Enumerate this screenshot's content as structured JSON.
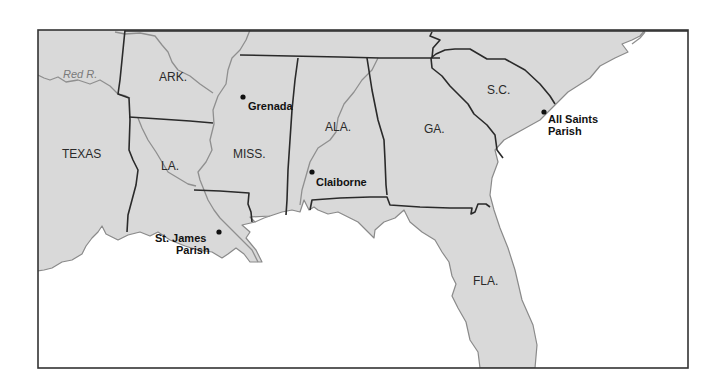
{
  "map": {
    "region": "Southeastern United States",
    "colors": {
      "land": "#d9d9d9",
      "water": "#ffffff",
      "state_border": "#2a2a2a",
      "river": "#8f8f8f",
      "frame": "#333333"
    },
    "states": [
      {
        "id": "texas",
        "label": "TEXAS"
      },
      {
        "id": "arkansas",
        "label": "ARK."
      },
      {
        "id": "louisiana",
        "label": "LA."
      },
      {
        "id": "mississippi",
        "label": "MISS."
      },
      {
        "id": "alabama",
        "label": "ALA."
      },
      {
        "id": "georgia",
        "label": "GA."
      },
      {
        "id": "south-carolina",
        "label": "S.C."
      },
      {
        "id": "florida",
        "label": "FLA."
      }
    ],
    "rivers": [
      {
        "id": "red-river",
        "label": "Red R."
      }
    ],
    "places": [
      {
        "id": "grenada",
        "line1": "Grenada",
        "line2": ""
      },
      {
        "id": "claiborne",
        "line1": "Claiborne",
        "line2": ""
      },
      {
        "id": "st-james-parish",
        "line1": "St. James",
        "line2": "Parish"
      },
      {
        "id": "all-saints-parish",
        "line1": "All Saints",
        "line2": "Parish"
      }
    ]
  }
}
